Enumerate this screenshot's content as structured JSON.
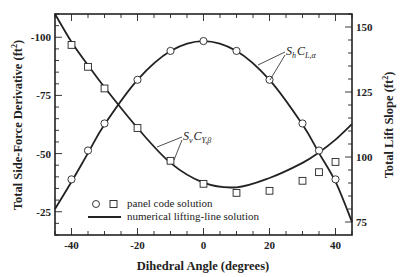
{
  "chart_data": {
    "type": "line",
    "title": "",
    "xlabel": "Dihedral Angle (degrees)",
    "ylabel": "Total Side-Force Derivative (ft²)",
    "y2label": "Total Lift Slope (ft²)",
    "xlim": [
      -45,
      45
    ],
    "ylim": [
      -110,
      -15
    ],
    "y2lim": [
      70,
      155
    ],
    "grid": false,
    "x_ticks": [
      -40,
      -20,
      0,
      20,
      40
    ],
    "y_ticks": [
      -100,
      -75,
      -50,
      -25
    ],
    "y2_ticks": [
      150,
      125,
      100,
      75
    ],
    "legend": {
      "position": "lower-left",
      "entries": [
        {
          "label": "panel code solution",
          "marker": "circle, square"
        },
        {
          "label": "numerical lifting-line solution",
          "marker": "solid line"
        }
      ]
    },
    "annotations": [
      {
        "text": "S_h C_{L,α}",
        "target": "lift slope curve"
      },
      {
        "text": "S_v C_{Y,β}",
        "target": "side-force curve"
      }
    ],
    "series": [
      {
        "name": "S_h C_{L,α} panel code solution",
        "axis": "right",
        "marker": "circle",
        "x": [
          -40,
          -35,
          -30,
          -20,
          -10,
          0,
          10,
          20,
          30,
          35,
          40
        ],
        "y": [
          91.4,
          102.5,
          112.9,
          129.7,
          140.8,
          144.6,
          140.8,
          129.7,
          112.9,
          102.5,
          91.4
        ]
      },
      {
        "name": "S_v C_{Y,β} panel code solution",
        "axis": "left",
        "marker": "square",
        "x": [
          -40,
          -35,
          -30,
          -20,
          -10,
          0,
          10,
          20,
          30,
          35,
          40
        ],
        "y": [
          -96.7,
          -87.3,
          -78.0,
          -61.0,
          -46.9,
          -37.0,
          -33.1,
          -34.0,
          -38.3,
          -42.0,
          -46.4
        ]
      },
      {
        "name": "S_h C_{L,α} numerical lifting-line solution",
        "axis": "right",
        "marker": "line",
        "x": [
          -45,
          -40,
          -35,
          -30,
          -20,
          -10,
          0,
          10,
          20,
          30,
          35,
          40,
          45
        ],
        "y": [
          80,
          90.5,
          101.5,
          112.5,
          129.7,
          140.8,
          144.6,
          140.8,
          129.7,
          112.5,
          101.5,
          90.5,
          75
        ]
      },
      {
        "name": "S_v C_{Y,β} numerical lifting-line solution",
        "axis": "left",
        "marker": "line",
        "x": [
          -45,
          -40,
          -35,
          -30,
          -20,
          -10,
          0,
          10,
          20,
          30,
          35,
          40,
          45
        ],
        "y": [
          -110,
          -98,
          -88,
          -78.5,
          -61,
          -46,
          -37.5,
          -35.5,
          -39.5,
          -46,
          -50.5,
          -56,
          -62.7
        ]
      }
    ]
  },
  "labels": {
    "xlabel": "Dihedral Angle (degrees)",
    "ylabel_main": "Total Side-Force Derivative (ft",
    "y2label_main": "Total Lift Slope (ft",
    "unit_sup": "2",
    "unit_close": ")",
    "legend_panel": "panel code solution",
    "legend_lifting": "numerical lifting-line solution",
    "anno_lift_S": "S",
    "anno_lift_Ssub": "h",
    "anno_lift_C": "C",
    "anno_lift_Csub": "L,α",
    "anno_side_S": "S",
    "anno_side_Ssub": "v",
    "anno_side_C": "C",
    "anno_side_Csub": "Y,β"
  },
  "colors": {
    "ink": "#222222",
    "background": "#ffffff"
  }
}
